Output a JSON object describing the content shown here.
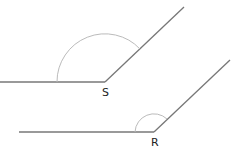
{
  "diagram": {
    "angles": [
      {
        "vertex_label": "S",
        "type": "obtuse",
        "vertex": [
          105,
          82
        ]
      },
      {
        "vertex_label": "R",
        "type": "obtuse",
        "vertex": [
          154,
          132
        ]
      }
    ],
    "colors": {
      "line": "#777777",
      "arc": "#bbbbbb",
      "text": "#222222"
    }
  }
}
